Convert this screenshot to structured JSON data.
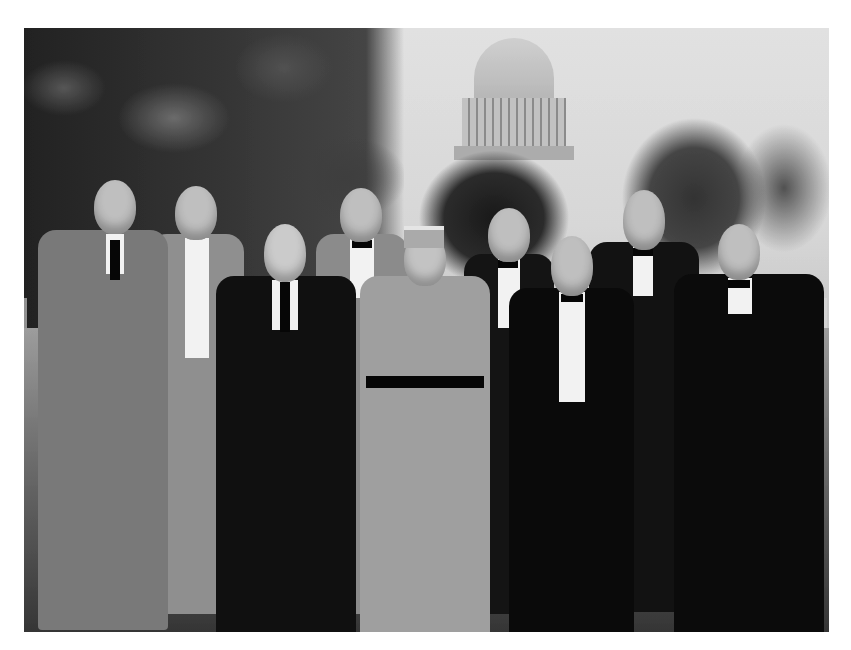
{
  "image": {
    "type": "photograph",
    "style": "black-and-white",
    "description": "Historical group portrait of nine men standing on a lawn in front of trees, with the U.S. Capitol dome visible in the background",
    "frame": {
      "left": 24,
      "top": 28,
      "width": 805,
      "height": 604
    },
    "background_color": "#ffffff",
    "tones": {
      "sky": "#d0d0d0",
      "trees": "#333333",
      "lawn": "#5a5a5a",
      "suits": "#1e1e1e",
      "light_suit": "#8a8a8a",
      "uniform": "#9c9c9c",
      "faces": "#b9b9b9",
      "shirts": "#e8e8e8"
    }
  },
  "scene": {
    "landmark": "Capitol dome",
    "people_count": 9,
    "people": [
      {
        "position": 1,
        "attire": "light tweed suit, hand on lapel",
        "x": 40,
        "width": 130
      },
      {
        "position": 2,
        "attire": "light suit, tie",
        "x": 150,
        "width": 95
      },
      {
        "position": 3,
        "attire": "dark three-piece suit, white hair and mustache",
        "x": 215,
        "width": 140
      },
      {
        "position": 4,
        "attire": "light suit, bow tie",
        "x": 315,
        "width": 90
      },
      {
        "position": 5,
        "attire": "military uniform with kepi cap, belt and boots",
        "x": 360,
        "width": 130
      },
      {
        "position": 6,
        "attire": "dark suit, bow tie",
        "x": 460,
        "width": 90
      },
      {
        "position": 7,
        "attire": "dark suit, bow tie, beard",
        "x": 505,
        "width": 125
      },
      {
        "position": 8,
        "attire": "dark suit, bow tie, full beard",
        "x": 585,
        "width": 110
      },
      {
        "position": 9,
        "attire": "dark overcoat, glasses, bow tie",
        "x": 670,
        "width": 150
      }
    ]
  }
}
